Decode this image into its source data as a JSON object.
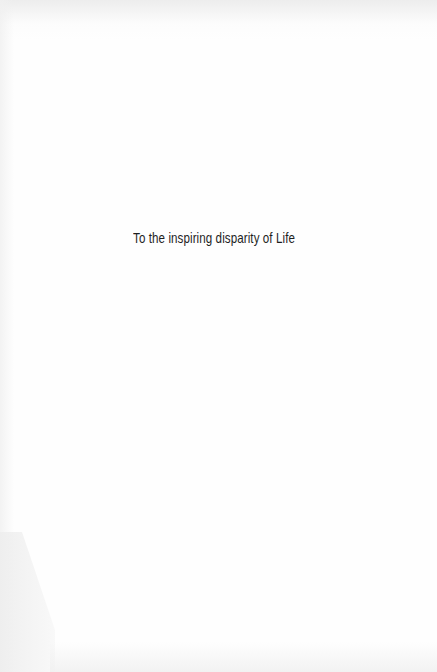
{
  "page": {
    "dedication": "To the inspiring disparity of Life"
  },
  "colors": {
    "background": "#fefefe",
    "text": "#1e1e1e"
  }
}
